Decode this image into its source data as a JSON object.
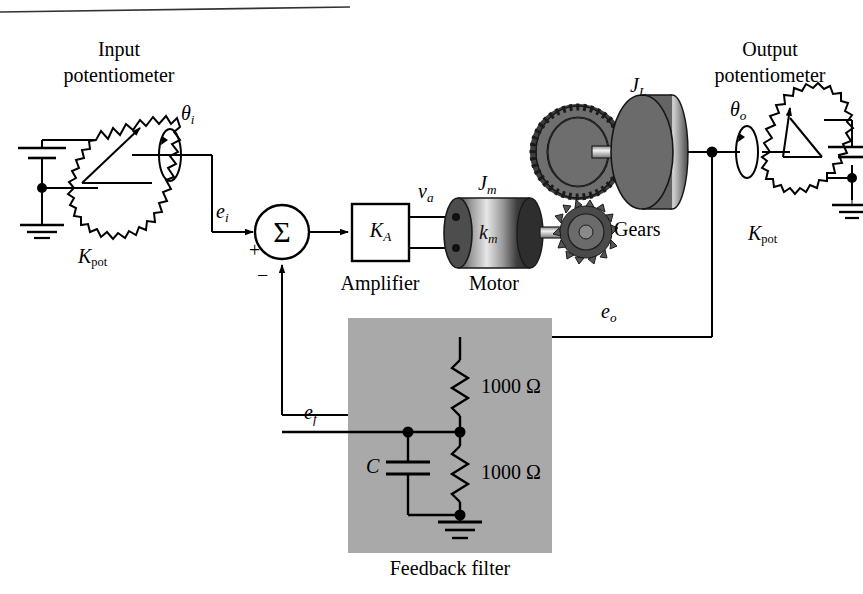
{
  "figure": {
    "title_rule": true
  },
  "colors": {
    "line": "#000000",
    "filter_box_fill": "#a9a9a9",
    "gear_fill": "#808080",
    "gear_tooth": "#404040",
    "disc_fill": "#6e6e6e",
    "motor_dark": "#3a3a3a",
    "motor_light": "#d8d8d8",
    "page_bg": "#ffffff"
  },
  "input_potentiometer": {
    "title_line1": "Input",
    "title_line2": "potentiometer",
    "gain_label_k": "K",
    "gain_label_sub": "pot",
    "angle_label_theta": "θ",
    "angle_label_sub": "i",
    "source_voltage_label": "",
    "output_signal_e": "e",
    "output_signal_sub": "i"
  },
  "summing_junction": {
    "symbol": "Σ",
    "plus_sign": "+",
    "minus_sign": "−"
  },
  "amplifier": {
    "block_label_k": "K",
    "block_label_sub": "A",
    "caption": "Amplifier",
    "output_signal_v": "v",
    "output_signal_sub": "a"
  },
  "motor": {
    "caption": "Motor",
    "inertia_label_j": "J",
    "inertia_label_sub": "m",
    "constant_label_k": "k",
    "constant_label_sub": "m"
  },
  "gears": {
    "caption": "Gears"
  },
  "load": {
    "inertia_label_j": "J",
    "inertia_label_sub": "L"
  },
  "output_potentiometer": {
    "title_line1": "Output",
    "title_line2": "potentiometer",
    "gain_label_k": "K",
    "gain_label_sub": "pot",
    "angle_label_theta": "θ",
    "angle_label_sub": "o",
    "output_signal_e": "e",
    "output_signal_sub": "o"
  },
  "feedback_filter": {
    "caption": "Feedback filter",
    "resistor_top_value": "1000 Ω",
    "resistor_bottom_value": "1000 Ω",
    "capacitor_label": "C",
    "feedback_signal_e": "e",
    "feedback_signal_sub": "f"
  }
}
